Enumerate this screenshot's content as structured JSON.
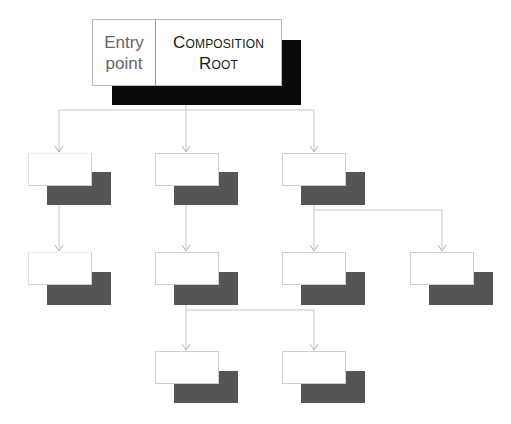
{
  "diagram": {
    "root": {
      "entry_label_line1": "Entry",
      "entry_label_line2": "point",
      "composition_label_line1": "Composition",
      "composition_label_line2": "Root"
    },
    "nodes": [
      {
        "id": "n1",
        "row": 1,
        "col": "left"
      },
      {
        "id": "n2",
        "row": 1,
        "col": "middle"
      },
      {
        "id": "n3",
        "row": 1,
        "col": "right"
      },
      {
        "id": "n4",
        "row": 2,
        "col": "left"
      },
      {
        "id": "n5",
        "row": 2,
        "col": "middle"
      },
      {
        "id": "n6",
        "row": 2,
        "col": "right"
      },
      {
        "id": "n7",
        "row": 2,
        "col": "far-right"
      },
      {
        "id": "n8",
        "row": 3,
        "col": "middle"
      },
      {
        "id": "n9",
        "row": 3,
        "col": "right"
      }
    ],
    "edges": [
      [
        "root",
        "n1"
      ],
      [
        "root",
        "n2"
      ],
      [
        "root",
        "n3"
      ],
      [
        "n1",
        "n4"
      ],
      [
        "n2",
        "n5"
      ],
      [
        "n3",
        "n6"
      ],
      [
        "n3",
        "n7"
      ],
      [
        "n5",
        "n8"
      ],
      [
        "n5",
        "n9"
      ]
    ],
    "colors": {
      "root_shadow": "#0a0a0a",
      "node_shadow": "#555555",
      "connector": "#cfcfcf"
    }
  }
}
